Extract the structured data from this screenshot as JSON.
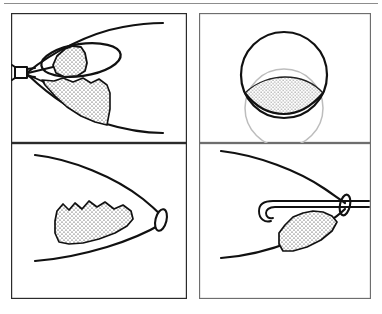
{
  "figure": {
    "kind": "multi-panel-line-drawing",
    "panel_count": 4,
    "layout": "2x2",
    "background_color": "#ffffff",
    "ink_color": "#111111",
    "frame_color": "#2b2b2b",
    "ghost_color": "#bdbdbd",
    "stipple_color": "#222222",
    "top_rule_color": "#8d8d8d"
  },
  "panels": [
    {
      "id": "panel-top-left",
      "position": "top-left",
      "view": "sagittal-cross-section",
      "description": "Tapered wedge cross-section of the eye seen from the side; a probe tip enters at the narrow left apex, an oval ring outlines a circular opening, and a dense stippled mass fills the lower chamber.",
      "elements": [
        {
          "name": "outer-contour-upper",
          "type": "curve"
        },
        {
          "name": "outer-contour-lower",
          "type": "curve"
        },
        {
          "name": "ring-ellipse",
          "type": "ellipse"
        },
        {
          "name": "stippled-mass-upper",
          "type": "stippled-region"
        },
        {
          "name": "stippled-mass-lower",
          "type": "stippled-region"
        },
        {
          "name": "probe-tip",
          "type": "instrument"
        }
      ]
    },
    {
      "id": "panel-top-right",
      "position": "top-right",
      "view": "en-face-frontal",
      "description": "Frontal view: a bold circle with a lens-shaped stippled crescent across its lower third, and a faint ghosted circle offset below.",
      "elements": [
        {
          "name": "main-circle",
          "type": "circle"
        },
        {
          "name": "ghost-circle",
          "type": "circle"
        },
        {
          "name": "stippled-crescent",
          "type": "stippled-region"
        },
        {
          "name": "crescent-chord",
          "type": "curve"
        }
      ]
    },
    {
      "id": "panel-bottom-left",
      "position": "bottom-left",
      "view": "sagittal-cross-section",
      "description": "Same tapered wedge turned so the apex points right; a small oval opening sits at the right apex and a stippled mass with a scalloped upper edge rests along the lower contour.",
      "elements": [
        {
          "name": "outer-contour-upper",
          "type": "curve"
        },
        {
          "name": "outer-contour-lower",
          "type": "curve"
        },
        {
          "name": "apex-oval",
          "type": "ellipse"
        },
        {
          "name": "stippled-mass",
          "type": "stippled-region"
        }
      ]
    },
    {
      "id": "panel-bottom-right",
      "position": "bottom-right",
      "view": "sagittal-cross-section",
      "description": "Tapered wedge with apex at the right; a hooked cannula passes through the oval opening at the apex and curves back over a stippled mass below it.",
      "elements": [
        {
          "name": "outer-contour-upper",
          "type": "curve"
        },
        {
          "name": "outer-contour-lower",
          "type": "curve"
        },
        {
          "name": "apex-oval",
          "type": "ellipse"
        },
        {
          "name": "hooked-cannula",
          "type": "instrument"
        },
        {
          "name": "stippled-mass",
          "type": "stippled-region"
        }
      ]
    }
  ],
  "labels": {
    "figure_caption": "",
    "panel_letters": [
      "",
      "",
      "",
      ""
    ]
  }
}
